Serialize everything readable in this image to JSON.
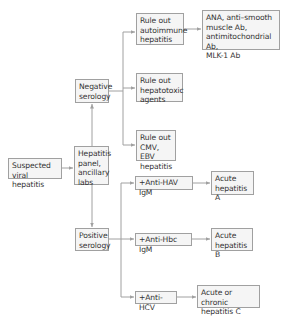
{
  "diagram": {
    "colors": {
      "box_fill": "#f5f5f5",
      "box_border": "#a0a0a0",
      "text": "#333333",
      "arrow": "#a0a0a0"
    },
    "nodes": {
      "suspected": {
        "label": "Suspected\nviral hepatitis"
      },
      "panel": {
        "label": "Hepatitis\npanel,\nancillary\nlabs"
      },
      "negative": {
        "label": "Negative\nserology"
      },
      "positive": {
        "label": "Positive\nserology"
      },
      "autoimmune": {
        "label": "Rule out\nautoimmune\nhepatitis"
      },
      "antibodies": {
        "label": "ANA, anti–smooth\nmuscle Ab,\nantimitochondrial Ab,\nMLK-1 Ab"
      },
      "hepatotoxic": {
        "label": "Rule out\nhepatotoxic\nagents"
      },
      "cmv_ebv": {
        "label": "Rule out\nCMV, EBV\nhepatitis"
      },
      "anti_hav": {
        "label": "+Anti-HAV IgM"
      },
      "acute_a": {
        "label": "Acute\nhepatitis A"
      },
      "anti_hbc": {
        "label": "+Anti-Hbc IgM"
      },
      "acute_b": {
        "label": "Acute\nhepatitis B"
      },
      "anti_hcv": {
        "label": "+Anti-HCV"
      },
      "acute_c": {
        "label": "Acute or chronic\nhepatitis C"
      }
    },
    "edges": [
      {
        "from": "suspected",
        "to": "panel"
      },
      {
        "from": "panel",
        "to": "negative"
      },
      {
        "from": "panel",
        "to": "positive"
      },
      {
        "from": "negative",
        "to": "autoimmune"
      },
      {
        "from": "negative",
        "to": "hepatotoxic"
      },
      {
        "from": "negative",
        "to": "cmv_ebv"
      },
      {
        "from": "autoimmune",
        "to": "antibodies"
      },
      {
        "from": "positive",
        "to": "anti_hav"
      },
      {
        "from": "positive",
        "to": "anti_hbc"
      },
      {
        "from": "positive",
        "to": "anti_hcv"
      },
      {
        "from": "anti_hav",
        "to": "acute_a"
      },
      {
        "from": "anti_hbc",
        "to": "acute_b"
      },
      {
        "from": "anti_hcv",
        "to": "acute_c"
      }
    ]
  }
}
